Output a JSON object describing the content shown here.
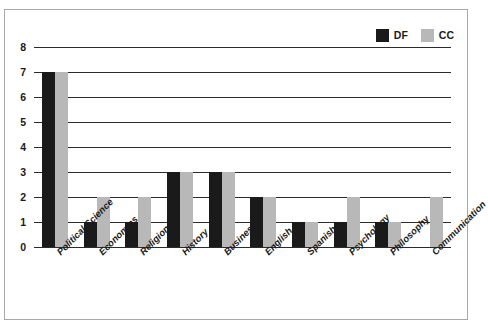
{
  "cut_off_text": "· ·",
  "legend": {
    "position": "top-right",
    "entries": [
      {
        "label": "DF",
        "color": "#1a1a1a",
        "swatch_name": "legend-swatch-df"
      },
      {
        "label": "CC",
        "color": "#b8b8b8",
        "swatch_name": "legend-swatch-cc"
      }
    ]
  },
  "yaxis": {
    "ticks": [
      "0",
      "1",
      "2",
      "3",
      "4",
      "5",
      "6",
      "7",
      "8"
    ]
  },
  "chart_data": {
    "type": "bar",
    "title": "",
    "xlabel": "",
    "ylabel": "",
    "ylim": [
      0,
      8
    ],
    "grid": true,
    "legend_position": "top-right",
    "categories": [
      "Political Science",
      "Economics",
      "Religion",
      "History",
      "Business",
      "English",
      "Spanish",
      "Psychology",
      "Philosophy",
      "Communication"
    ],
    "series": [
      {
        "name": "DF",
        "color": "#1a1a1a",
        "values": [
          7,
          1,
          1,
          3,
          3,
          2,
          1,
          1,
          1,
          0
        ]
      },
      {
        "name": "CC",
        "color": "#b8b8b8",
        "values": [
          7,
          2,
          2,
          3,
          3,
          2,
          1,
          2,
          1,
          2
        ]
      }
    ]
  }
}
